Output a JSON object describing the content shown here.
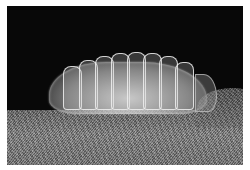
{
  "image": {
    "subject": "translucent segmented larva",
    "background": "black",
    "surface": "grainy textured ground",
    "border_color": "#ffffff",
    "background_color": "#080808",
    "surface_color": "#7a7a7a",
    "larva_color": "#d8d8d8",
    "segments": [
      {
        "x": 18,
        "y": 14
      },
      {
        "x": 34,
        "y": 8
      },
      {
        "x": 50,
        "y": 4
      },
      {
        "x": 66,
        "y": 1
      },
      {
        "x": 82,
        "y": 0
      },
      {
        "x": 98,
        "y": 1
      },
      {
        "x": 114,
        "y": 4
      },
      {
        "x": 130,
        "y": 10
      }
    ]
  }
}
